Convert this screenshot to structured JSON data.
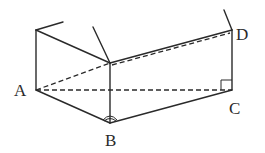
{
  "diagram": {
    "type": "geometry-figure",
    "labels": {
      "A": "A",
      "B": "B",
      "C": "C",
      "D": "D"
    },
    "points": {
      "A": [
        36,
        90
      ],
      "B": [
        110,
        123
      ],
      "C": [
        232,
        90
      ],
      "D": [
        232,
        30
      ],
      "top_left": [
        36,
        30
      ],
      "top_mid": [
        110,
        63
      ]
    },
    "solid_edges": [
      [
        "top_left",
        "A"
      ],
      [
        "top_left",
        "top_mid"
      ],
      [
        "top_mid",
        "B"
      ],
      [
        "top_mid",
        "D"
      ],
      [
        "D",
        "C"
      ],
      [
        "A",
        "B"
      ],
      [
        "B",
        "C"
      ]
    ],
    "dashed_edges": [
      [
        "A",
        "C"
      ],
      [
        "A",
        "top_mid"
      ],
      [
        "top_mid",
        "D"
      ]
    ],
    "markers": {
      "right_angle_at": "C",
      "arc_at": "B"
    },
    "stroke_color": "#2a2a2a"
  }
}
